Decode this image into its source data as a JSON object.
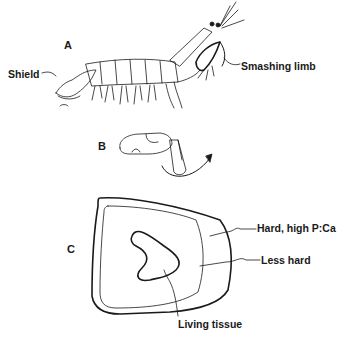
{
  "panels": {
    "a": {
      "letter": "A",
      "labels": {
        "shield": "Shield",
        "smashing_limb": "Smashing limb"
      }
    },
    "b": {
      "letter": "B"
    },
    "c": {
      "letter": "C",
      "labels": {
        "outer": "Hard, high  P:Ca",
        "middle": "Less hard",
        "inner": "Living tissue"
      }
    }
  },
  "colors": {
    "ink": "#1a1a1a",
    "background": "#ffffff"
  }
}
